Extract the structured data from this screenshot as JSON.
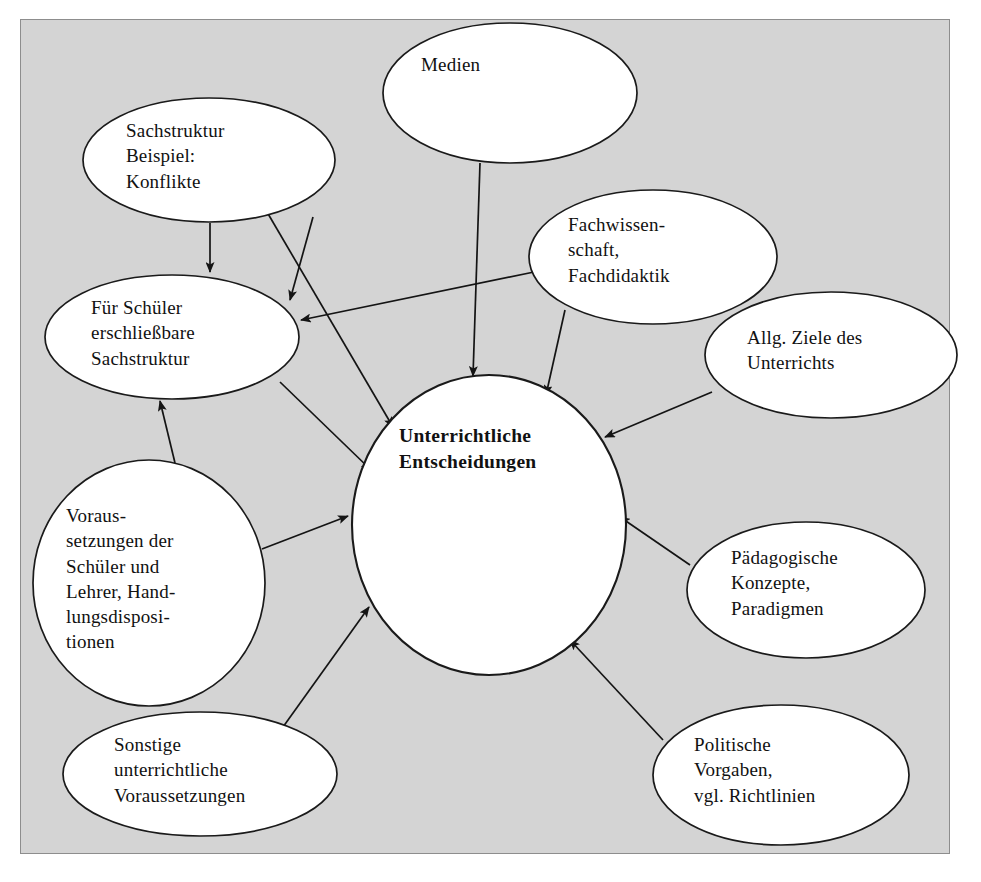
{
  "diagram": {
    "title": "Unterrichtliche Entscheidungen",
    "background_color": "#d4d4d4",
    "page_color": "#ffffff",
    "node_fill": "#ffffff",
    "line_color": "#141414",
    "nodes": [
      {
        "id": "medien",
        "label": "Medien",
        "shape": "ellipse",
        "cx": 510,
        "cy": 93,
        "rx": 127,
        "ry": 70,
        "text_x": 421,
        "text_y": 52,
        "text_align": "left"
      },
      {
        "id": "sachstruktur-beispiel",
        "label": "Sachstruktur\nBeispiel:\nKonflikte",
        "shape": "ellipse",
        "cx": 209,
        "cy": 160,
        "rx": 126,
        "ry": 62,
        "text_x": 126,
        "text_y": 118,
        "text_align": "left"
      },
      {
        "id": "fachwissenschaft",
        "label": "Fachwissen-\nschaft,\nFachdidaktik",
        "shape": "ellipse",
        "cx": 653,
        "cy": 257,
        "rx": 124,
        "ry": 67,
        "text_x": 568,
        "text_y": 212,
        "text_align": "left"
      },
      {
        "id": "allg-ziele",
        "label": "Allg. Ziele des\nUnterrichts",
        "shape": "ellipse",
        "cx": 831,
        "cy": 355,
        "rx": 126,
        "ry": 63,
        "text_x": 747,
        "text_y": 325,
        "text_align": "left"
      },
      {
        "id": "fuer-schueler-sachstruktur",
        "label": "Für Schüler\nerschließbare\nSachstruktur",
        "shape": "ellipse",
        "cx": 172,
        "cy": 337,
        "rx": 127,
        "ry": 62,
        "text_x": 91,
        "text_y": 295,
        "text_align": "left"
      },
      {
        "id": "unterrichtliche-entscheidungen",
        "label": "Unterrichtliche\nEntscheidungen",
        "shape": "ellipse",
        "cx": 489,
        "cy": 525,
        "rx": 137,
        "ry": 150,
        "text_x": 399,
        "text_y": 423,
        "text_align": "left"
      },
      {
        "id": "voraussetzungen",
        "label": "Voraus-\nsetzungen der\nSchüler und\nLehrer, Hand-\nlungsdisposi-\ntionen",
        "shape": "ellipse",
        "cx": 149,
        "cy": 583,
        "rx": 116,
        "ry": 123,
        "text_x": 66,
        "text_y": 503,
        "text_align": "left"
      },
      {
        "id": "paedagogische-konzepte",
        "label": "Pädagogische\nKonzepte,\nParadigmen",
        "shape": "ellipse",
        "cx": 806,
        "cy": 590,
        "rx": 119,
        "ry": 68,
        "text_x": 731,
        "text_y": 545,
        "text_align": "left"
      },
      {
        "id": "sonstige-voraussetzungen",
        "label": "Sonstige\nunterrichtliche\nVoraussetzungen",
        "shape": "ellipse",
        "cx": 200,
        "cy": 774,
        "rx": 137,
        "ry": 62,
        "text_x": 114,
        "text_y": 732,
        "text_align": "left"
      },
      {
        "id": "politische-vorgaben",
        "label": "Politische\nVorgaben,\nvgl. Richtlinien",
        "shape": "ellipse",
        "cx": 781,
        "cy": 775,
        "rx": 128,
        "ry": 70,
        "text_x": 694,
        "text_y": 732,
        "text_align": "left"
      }
    ],
    "edges": [
      {
        "id": "sachstruktur-to-fuerschueler",
        "from": "sachstruktur-beispiel",
        "to": "fuer-schueler-sachstruktur",
        "x1": 210,
        "y1": 223,
        "x2": 210,
        "y2": 272,
        "arrow": true
      },
      {
        "id": "medien-to-fuerschueler",
        "from": "medien",
        "to": "fuer-schueler-sachstruktur",
        "x1": 313,
        "y1": 217,
        "x2": 290,
        "y2": 300,
        "arrow": true
      },
      {
        "id": "fachwissenschaft-to-fuerschueler",
        "from": "fachwissenschaft",
        "to": "fuer-schueler-sachstruktur",
        "x1": 534,
        "y1": 272,
        "x2": 301,
        "y2": 320,
        "arrow": true
      },
      {
        "id": "medien-to-zentrum",
        "from": "medien",
        "to": "unterrichtliche-entscheidungen",
        "x1": 480,
        "y1": 163,
        "x2": 473,
        "y2": 376,
        "arrow": true
      },
      {
        "id": "fachwissenschaft-to-zentrum",
        "from": "fachwissenschaft",
        "to": "unterrichtliche-entscheidungen",
        "x1": 565,
        "y1": 310,
        "x2": 546,
        "y2": 395,
        "arrow": true
      },
      {
        "id": "allgziele-to-zentrum",
        "from": "allg-ziele",
        "to": "unterrichtliche-entscheidungen",
        "x1": 712,
        "y1": 392,
        "x2": 605,
        "y2": 437,
        "arrow": true
      },
      {
        "id": "sachstruktur-to-zentrum",
        "from": "sachstruktur-beispiel",
        "to": "unterrichtliche-entscheidungen",
        "x1": 267,
        "y1": 212,
        "x2": 393,
        "y2": 427,
        "arrow": true
      },
      {
        "id": "fuerschueler-to-zentrum",
        "from": "fuer-schueler-sachstruktur",
        "to": "unterrichtliche-entscheidungen",
        "x1": 280,
        "y1": 382,
        "x2": 371,
        "y2": 470,
        "arrow": true
      },
      {
        "id": "voraussetzungen-to-fuerschueler",
        "from": "voraussetzungen",
        "to": "fuer-schueler-sachstruktur",
        "x1": 175,
        "y1": 463,
        "x2": 160,
        "y2": 401,
        "arrow": true
      },
      {
        "id": "voraussetzungen-to-zentrum",
        "from": "voraussetzungen",
        "to": "unterrichtliche-entscheidungen",
        "x1": 262,
        "y1": 549,
        "x2": 348,
        "y2": 516,
        "arrow": true
      },
      {
        "id": "sonstige-to-zentrum",
        "from": "sonstige-voraussetzungen",
        "to": "unterrichtliche-entscheidungen",
        "x1": 283,
        "y1": 727,
        "x2": 369,
        "y2": 607,
        "arrow": true
      },
      {
        "id": "paedagogische-to-zentrum",
        "from": "paedagogische-konzepte",
        "to": "unterrichtliche-entscheidungen",
        "x1": 690,
        "y1": 565,
        "x2": 620,
        "y2": 517,
        "arrow": true
      },
      {
        "id": "politische-to-zentrum",
        "from": "politische-vorgaben",
        "to": "unterrichtliche-entscheidungen",
        "x1": 663,
        "y1": 740,
        "x2": 570,
        "y2": 640,
        "arrow": true
      }
    ]
  }
}
